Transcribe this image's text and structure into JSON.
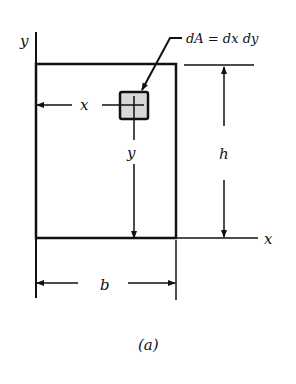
{
  "figure": {
    "caption": "(a)",
    "labels": {
      "y_axis": "y",
      "x_axis": "x",
      "element": "dA = dx dy",
      "x_dist": "x",
      "y_dist": "y",
      "height": "h",
      "width": "b"
    },
    "colors": {
      "line": "#111111",
      "element_fill": "#d8d8d8",
      "background": "#ffffff"
    }
  }
}
